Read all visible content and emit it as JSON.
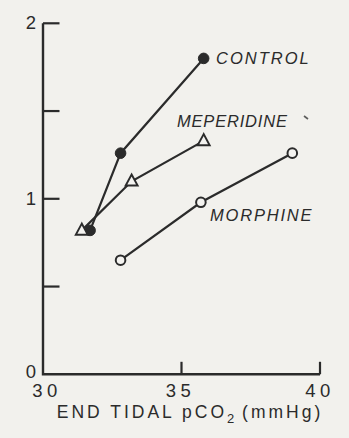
{
  "figure": {
    "background": "#f2f1ed",
    "paper_fill": "#f4f3f0",
    "ink": "#2b2b2b"
  },
  "chart_data": {
    "type": "line",
    "title": "",
    "xlabel_pre": "END TIDAL pCO",
    "xlabel_sub": "2",
    "xlabel_post": " (mmHg)",
    "ylabel": "",
    "xlim": [
      30,
      40
    ],
    "ylim": [
      0,
      2
    ],
    "grid": false,
    "legend_position": "inline-annotations",
    "x_ticks": [
      {
        "value": 30,
        "label": "30",
        "mark": false,
        "label_dx": 4
      },
      {
        "value": 35,
        "label": "35",
        "mark": true,
        "label_dx": -1
      },
      {
        "value": 40,
        "label": "40",
        "mark": true,
        "label_dx": 0
      }
    ],
    "y_ticks": [
      {
        "value": 0,
        "label": "0",
        "mark": false,
        "label_dy": -2
      },
      {
        "value": 0.5,
        "label": "",
        "mark": true,
        "label_dy": 0
      },
      {
        "value": 1,
        "label": "1",
        "mark": true,
        "label_dy": 0
      },
      {
        "value": 1.5,
        "label": "",
        "mark": true,
        "label_dy": 0
      },
      {
        "value": 2,
        "label": "2",
        "mark": true,
        "label_dy": 0
      }
    ],
    "series": [
      {
        "name": "CONTROL",
        "marker": "filled-circle",
        "points": [
          [
            31.7,
            0.82
          ],
          [
            32.8,
            1.26
          ],
          [
            35.8,
            1.8
          ]
        ],
        "label_x": 216,
        "label_y": 64,
        "letter_spacing": 2
      },
      {
        "name": "MEPERIDINE",
        "marker": "open-triangle",
        "points": [
          [
            31.4,
            0.82
          ],
          [
            33.2,
            1.1
          ],
          [
            35.8,
            1.33
          ]
        ],
        "label_x": 177,
        "label_y": 127,
        "letter_spacing": 0.8
      },
      {
        "name": "MORPHINE",
        "marker": "open-circle",
        "points": [
          [
            32.8,
            0.65
          ],
          [
            35.7,
            0.98
          ],
          [
            39.0,
            1.26
          ]
        ],
        "label_x": 210,
        "label_y": 221,
        "letter_spacing": 1.8
      }
    ]
  }
}
